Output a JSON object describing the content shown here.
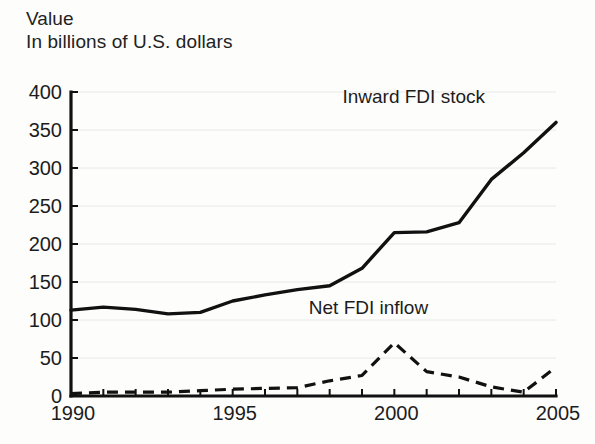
{
  "header": {
    "title": "Value",
    "subtitle": "In billions of U.S. dollars"
  },
  "chart_data": {
    "type": "line",
    "title": "Value",
    "subtitle": "In billions of U.S. dollars",
    "xlabel": "",
    "ylabel": "In billions of U.S. dollars",
    "xlim": [
      1990,
      2005
    ],
    "ylim": [
      0,
      400
    ],
    "ytick_labels": [
      "0",
      "50",
      "100",
      "150",
      "200",
      "250",
      "300",
      "350",
      "400"
    ],
    "ytick_values": [
      0,
      50,
      100,
      150,
      200,
      250,
      300,
      350,
      400
    ],
    "xtick_labels": [
      "1990",
      "1995",
      "2000",
      "2005"
    ],
    "xtick_values": [
      1990,
      1995,
      2000,
      2005
    ],
    "x": [
      1990,
      1991,
      1992,
      1993,
      1994,
      1995,
      1996,
      1997,
      1998,
      1999,
      2000,
      2001,
      2002,
      2003,
      2004,
      2005
    ],
    "grid": true,
    "grid_axis": "y",
    "legend_position": "inline-annotation",
    "series": [
      {
        "name": "Inward FDI stock",
        "style": "solid",
        "label_x": 2000.6,
        "label_y": 385,
        "values": [
          113,
          117,
          114,
          108,
          110,
          125,
          133,
          140,
          145,
          168,
          215,
          216,
          228,
          285,
          320,
          360
        ]
      },
      {
        "name": "Net FDI inflow",
        "style": "dashed",
        "label_x": 1999.2,
        "label_y": 108,
        "values": [
          3,
          5,
          5,
          5,
          7,
          9,
          10,
          11,
          20,
          27,
          70,
          32,
          25,
          12,
          5,
          38
        ]
      }
    ]
  }
}
